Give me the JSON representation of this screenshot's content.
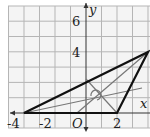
{
  "diagram": {
    "type": "coordinate-plane-triangle",
    "axes": {
      "x_label": "x",
      "y_label": "y",
      "origin_label": "O",
      "x_tick_labels": [
        "-4",
        "-2",
        "2"
      ],
      "y_tick_labels": [
        "4",
        "6"
      ],
      "grid_x_range": [
        -5,
        4
      ],
      "grid_y_range": [
        -1,
        7
      ]
    },
    "triangle": {
      "vertices": [
        [
          -4,
          0
        ],
        [
          2,
          0
        ],
        [
          4,
          4
        ]
      ],
      "stroke_color": "#111111"
    },
    "inner_lines": {
      "color": "#777777",
      "segments": [
        {
          "from": [
            4,
            4
          ],
          "to": [
            -0.6,
            0
          ]
        },
        {
          "from": [
            -4,
            0
          ],
          "to": [
            3.6,
            1.6
          ]
        },
        {
          "from": [
            2,
            0
          ],
          "to": [
            0,
            2.2
          ]
        }
      ]
    },
    "colors": {
      "grid": "#b5b5b5",
      "background": "#f4f4f4",
      "axis": "#333333"
    }
  }
}
